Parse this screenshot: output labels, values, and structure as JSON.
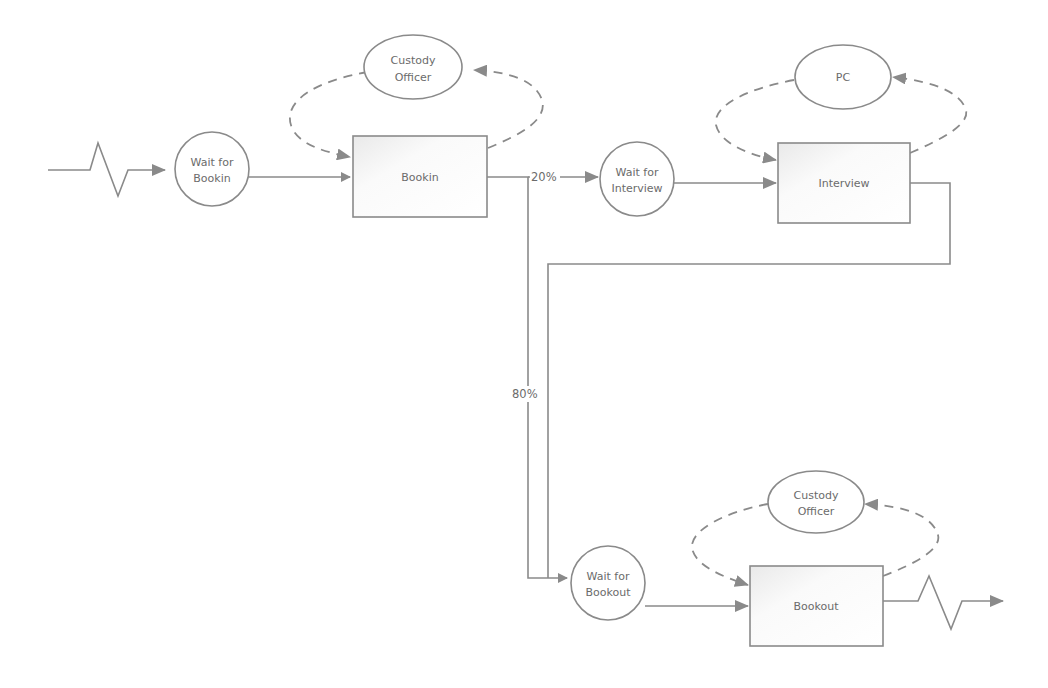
{
  "diagram": {
    "type": "process-flow",
    "colors": {
      "line": "#8a8a8a",
      "text": "#6b6b6b",
      "background": "#ffffff"
    },
    "nodes": [
      {
        "id": "wait_bookin",
        "shape": "circle",
        "label_line1": "Wait for",
        "label_line2": "Bookin"
      },
      {
        "id": "bookin",
        "shape": "rectangle",
        "label": "Bookin"
      },
      {
        "id": "resource_custody_1",
        "shape": "ellipse",
        "label_line1": "Custody",
        "label_line2": "Officer"
      },
      {
        "id": "wait_interview",
        "shape": "circle",
        "label_line1": "Wait for",
        "label_line2": "Interview"
      },
      {
        "id": "interview",
        "shape": "rectangle",
        "label": "Interview"
      },
      {
        "id": "resource_pc",
        "shape": "ellipse",
        "label": "PC"
      },
      {
        "id": "wait_bookout",
        "shape": "circle",
        "label_line1": "Wait for",
        "label_line2": "Bookout"
      },
      {
        "id": "bookout",
        "shape": "rectangle",
        "label": "Bookout"
      },
      {
        "id": "resource_custody_2",
        "shape": "ellipse",
        "label_line1": "Custody",
        "label_line2": "Officer"
      }
    ],
    "edges": [
      {
        "from": "arrival",
        "to": "wait_bookin",
        "style": "zigzag-arrival"
      },
      {
        "from": "wait_bookin",
        "to": "bookin"
      },
      {
        "from": "bookin",
        "to": "wait_interview",
        "label": "20%"
      },
      {
        "from": "bookin",
        "to": "wait_bookout",
        "label": "80%"
      },
      {
        "from": "wait_interview",
        "to": "interview"
      },
      {
        "from": "interview",
        "to": "wait_bookout"
      },
      {
        "from": "wait_bookout",
        "to": "bookout"
      },
      {
        "from": "bookout",
        "to": "exit",
        "style": "zigzag-exit"
      },
      {
        "from": "resource_custody_1",
        "to": "bookin",
        "style": "dashed-cycle"
      },
      {
        "from": "resource_pc",
        "to": "interview",
        "style": "dashed-cycle"
      },
      {
        "from": "resource_custody_2",
        "to": "bookout",
        "style": "dashed-cycle"
      }
    ],
    "edge_labels": {
      "to_interview": "20%",
      "to_bookout": "80%"
    }
  }
}
